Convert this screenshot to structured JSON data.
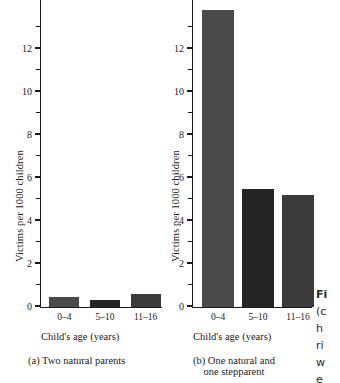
{
  "figure": {
    "side_caption_fragments": [
      "Fi",
      "(c",
      "h",
      "ri",
      "w",
      "e"
    ]
  },
  "chart_data": [
    {
      "type": "bar",
      "panel_label": "(a) Two natural parents",
      "panel_label_line1": "(a) Two natural parents",
      "panel_label_line2": "",
      "title": "",
      "xlabel": "Child's age (years)",
      "ylabel": "Victims per 1000 children",
      "categories": [
        "0–4",
        "5–10",
        "11–16"
      ],
      "values": [
        0.45,
        0.3,
        0.6
      ],
      "ylim": [
        0,
        14.3
      ],
      "ytick_major": [
        0,
        2,
        4,
        6,
        8,
        10,
        12
      ],
      "ytick_minor": [
        1,
        3,
        5,
        7,
        9,
        11,
        13
      ],
      "ytick_labels": [
        "0",
        "2",
        "4",
        "6",
        "8",
        "10",
        "12"
      ],
      "grid": false,
      "legend": "none",
      "bar_colors": [
        "#4a4a4a",
        "#242424",
        "#3a3a3a"
      ]
    },
    {
      "type": "bar",
      "panel_label": "(b) One natural and one stepparent",
      "panel_label_line1": "(b) One natural and",
      "panel_label_line2": "one stepparent",
      "title": "",
      "xlabel": "Child's age (years)",
      "ylabel": "Victims per 1000 children",
      "categories": [
        "0–4",
        "5–10",
        "11–16"
      ],
      "values": [
        13.8,
        5.45,
        5.2
      ],
      "ylim": [
        0,
        14.3
      ],
      "ytick_major": [
        0,
        2,
        4,
        6,
        8,
        10,
        12
      ],
      "ytick_minor": [
        1,
        3,
        5,
        7,
        9,
        11,
        13
      ],
      "ytick_labels": [
        "0",
        "2",
        "4",
        "6",
        "8",
        "10",
        "12"
      ],
      "grid": false,
      "legend": "none",
      "bar_colors": [
        "#4a4a4a",
        "#242424",
        "#3a3a3a"
      ]
    }
  ]
}
